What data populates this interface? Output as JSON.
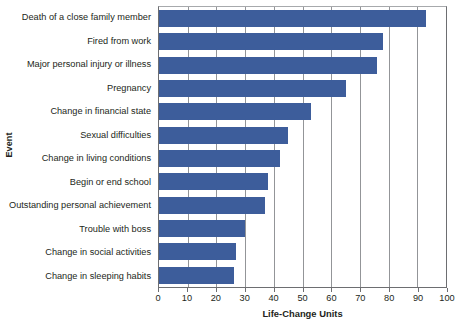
{
  "chart_data": {
    "type": "bar",
    "orientation": "horizontal",
    "title": "",
    "xlabel": "Life-Change Units",
    "ylabel": "Event",
    "xlim": [
      0,
      100
    ],
    "xticks": [
      0,
      10,
      20,
      30,
      40,
      50,
      60,
      70,
      80,
      90,
      100
    ],
    "grid": true,
    "legend": false,
    "bar_color": "#3d5d9b",
    "categories": [
      "Death of a close family member",
      "Fired from work",
      "Major personal injury or illness",
      "Pregnancy",
      "Change in financial state",
      "Sexual difficulties",
      "Change in living conditions",
      "Begin or end school",
      "Outstanding personal achievement",
      "Trouble with boss",
      "Change in social activities",
      "Change in sleeping habits"
    ],
    "values": [
      93,
      78,
      76,
      65,
      53,
      45,
      42,
      38,
      37,
      30,
      27,
      26
    ]
  }
}
